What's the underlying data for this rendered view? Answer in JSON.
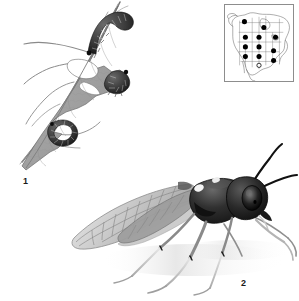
{
  "plate": {
    "title": "Sawfly life-stage plate",
    "background_color": "#ffffff",
    "ink_color": "#1a1a1a"
  },
  "figures": [
    {
      "number": "1",
      "name": "larvae-on-leaf",
      "caption_label": "1",
      "description": "Sawfly larvae feeding on a chewed leaf attached to a twig"
    },
    {
      "number": "2",
      "name": "adult-sawfly",
      "caption_label": "2",
      "description": "Adult sawfly in lateral view with veined wings and long antennae"
    }
  ],
  "labels": {
    "figure_one": "1",
    "figure_two": "2"
  },
  "distribution_map": {
    "name": "north-america-distribution-map",
    "region": "North America",
    "frame_color": "#8d8d8d",
    "marker_color": "#000000",
    "marker_count": 12,
    "open_marker_count": 1,
    "markers": [
      {
        "x": 20,
        "y": 17,
        "filled": true
      },
      {
        "x": 40,
        "y": 23,
        "filled": true
      },
      {
        "x": 21,
        "y": 33,
        "filled": true
      },
      {
        "x": 35,
        "y": 33,
        "filled": true
      },
      {
        "x": 52,
        "y": 33,
        "filled": true
      },
      {
        "x": 21,
        "y": 43,
        "filled": true
      },
      {
        "x": 35,
        "y": 43,
        "filled": true
      },
      {
        "x": 21,
        "y": 53,
        "filled": true
      },
      {
        "x": 35,
        "y": 53,
        "filled": true
      },
      {
        "x": 50,
        "y": 47,
        "filled": true
      },
      {
        "x": 50,
        "y": 57,
        "filled": true
      },
      {
        "x": 35,
        "y": 62,
        "filled": false
      }
    ]
  },
  "colors": {
    "paper": "#ffffff",
    "line": "#1a1a1a",
    "leaf_fill": "#a8a8a8",
    "leaf_shadow": "#8a8a8a",
    "body_dark": "#222222",
    "wing_fill": "#cfcfcf",
    "map_border": "#8d8d8d"
  }
}
